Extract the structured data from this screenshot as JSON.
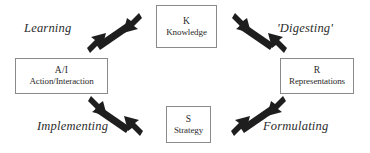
{
  "diagram": {
    "background_color": "#ffffff",
    "box_border_color": "#8a8a8a",
    "arrow_color": "#1e1e1e",
    "text_color": "#2b2b2b",
    "nodes": [
      {
        "id": "knowledge",
        "code": "K",
        "name": "Knowledge",
        "position": "top"
      },
      {
        "id": "action",
        "code": "A/I",
        "name": "Action/Interaction",
        "position": "left"
      },
      {
        "id": "representations",
        "code": "R",
        "name": "Representations",
        "position": "right"
      },
      {
        "id": "strategy",
        "code": "S",
        "name": "Strategy",
        "position": "bottom"
      }
    ],
    "connections": [
      {
        "id": "learning",
        "label": "Learning",
        "from": "action",
        "to": "knowledge",
        "style": "double-headed",
        "position": "top-left"
      },
      {
        "id": "digesting",
        "label": "'Digesting'",
        "from": "knowledge",
        "to": "representations",
        "style": "double-headed",
        "position": "top-right"
      },
      {
        "id": "implementing",
        "label": "Implementing",
        "from": "strategy",
        "to": "action",
        "style": "double-headed",
        "position": "bottom-left"
      },
      {
        "id": "formulating",
        "label": "Formulating",
        "from": "representations",
        "to": "strategy",
        "style": "double-headed",
        "position": "bottom-right"
      }
    ]
  }
}
